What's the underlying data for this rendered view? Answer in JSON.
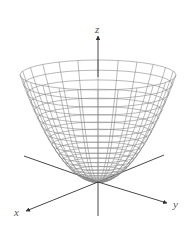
{
  "figure": {
    "surface": {
      "type": "paraboloid",
      "vertex": [
        98,
        182
      ],
      "rim_center_y": 75,
      "rim_rx": 78,
      "rim_ry": 15,
      "rings": 22,
      "meridians": 24,
      "line_color": "#8a8a8a",
      "line_width": 0.6
    },
    "axes": {
      "color": "#333333",
      "origin": [
        98,
        182
      ],
      "z": {
        "label": "z",
        "end": [
          98,
          36
        ],
        "bottom": [
          98,
          216
        ]
      },
      "x": {
        "label": "x",
        "end": [
          26,
          211
        ],
        "back": [
          24,
          156
        ]
      },
      "y": {
        "label": "y",
        "end": [
          167,
          203
        ],
        "back": [
          164,
          155
        ]
      }
    }
  }
}
